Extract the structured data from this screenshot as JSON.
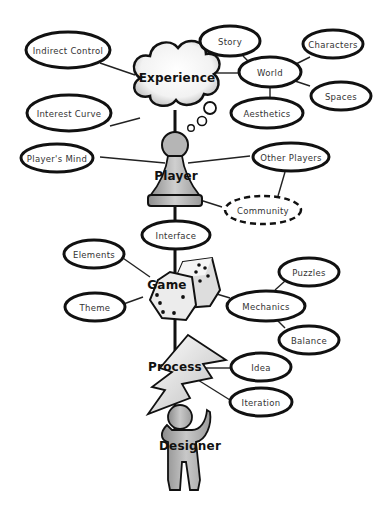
{
  "diagram": {
    "hubs": {
      "experience": "Experience",
      "player": "Player",
      "game": "Game",
      "process": "Process",
      "designer": "Designer"
    },
    "nodes": {
      "indirect_control": "Indirect Control",
      "interest_curve": "Interest Curve",
      "story": "Story",
      "world": "World",
      "characters": "Characters",
      "spaces": "Spaces",
      "aesthetics": "Aesthetics",
      "players_mind": "Player's Mind",
      "other_players": "Other Players",
      "community": "Community",
      "interface": "Interface",
      "elements": "Elements",
      "theme": "Theme",
      "mechanics": "Mechanics",
      "puzzles": "Puzzles",
      "balance": "Balance",
      "idea": "Idea",
      "iteration": "Iteration"
    },
    "colors": {
      "outline": "#111111",
      "fill_gray": "#b8b8b8",
      "fill_white": "#ffffff"
    }
  }
}
